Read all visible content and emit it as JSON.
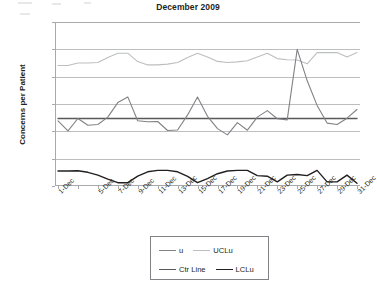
{
  "chart_data": {
    "type": "line",
    "title": "December 2009",
    "xlabel": "",
    "ylabel": "Concerns per Patient",
    "ylim": [
      0.0,
      6.0
    ],
    "ytick_values": [
      0.0,
      1.0,
      2.0,
      3.0,
      4.0,
      5.0,
      6.0
    ],
    "ytick_labels": [
      "0.00",
      "1.00",
      "2.00",
      "3.00",
      "4.00",
      "5.00",
      "6.00"
    ],
    "grid": true,
    "legend_position": "bottom",
    "x": [
      1,
      2,
      3,
      4,
      5,
      6,
      7,
      8,
      9,
      10,
      11,
      12,
      13,
      14,
      15,
      16,
      17,
      18,
      19,
      20,
      21,
      22,
      23,
      24,
      25,
      26,
      27,
      28,
      29,
      30,
      31
    ],
    "xtick_labels": [
      "1-Dec",
      "",
      "5-Dec",
      "7-Dec",
      "9-Dec",
      "11-Dec",
      "13-Dec",
      "15-Dec",
      "17-Dec",
      "19-Dec",
      "21-Dec",
      "23-Dec",
      "25-Dec",
      "27-Dec",
      "29-Dec",
      "31-Dec"
    ],
    "xtick_positions": [
      1,
      3,
      5,
      7,
      9,
      11,
      13,
      15,
      17,
      19,
      21,
      23,
      25,
      27,
      29,
      31
    ],
    "series": [
      {
        "name": "u",
        "color": "#808285",
        "width": 1.1,
        "values": [
          2.38,
          2.02,
          2.47,
          2.22,
          2.25,
          2.52,
          3.05,
          3.26,
          2.39,
          2.35,
          2.36,
          2.03,
          2.05,
          2.6,
          3.26,
          2.55,
          2.1,
          1.87,
          2.32,
          2.04,
          2.52,
          2.76,
          2.46,
          2.42,
          5.0,
          3.85,
          2.95,
          2.3,
          2.25,
          2.48,
          2.8
        ]
      },
      {
        "name": "UCLu",
        "color": "#bcbec0",
        "width": 1.1,
        "values": [
          4.41,
          4.41,
          4.5,
          4.5,
          4.52,
          4.7,
          4.86,
          4.86,
          4.55,
          4.43,
          4.43,
          4.46,
          4.52,
          4.7,
          4.86,
          4.72,
          4.56,
          4.52,
          4.54,
          4.58,
          4.72,
          4.86,
          4.66,
          4.62,
          4.61,
          4.47,
          4.88,
          4.88,
          4.88,
          4.72,
          4.88
        ]
      },
      {
        "name": "Ctr Line",
        "color": "#58595b",
        "width": 1.4,
        "values": [
          2.47,
          2.47,
          2.47,
          2.47,
          2.47,
          2.47,
          2.47,
          2.47,
          2.47,
          2.47,
          2.47,
          2.47,
          2.47,
          2.47,
          2.47,
          2.47,
          2.47,
          2.47,
          2.47,
          2.47,
          2.47,
          2.47,
          2.47,
          2.47,
          2.47,
          2.47,
          2.47,
          2.47,
          2.47,
          2.47,
          2.47
        ]
      },
      {
        "name": "LCLu",
        "color": "#231f20",
        "width": 1.4,
        "values": [
          0.55,
          0.55,
          0.56,
          0.5,
          0.4,
          0.25,
          0.12,
          0.12,
          0.36,
          0.52,
          0.57,
          0.57,
          0.52,
          0.35,
          0.12,
          0.27,
          0.45,
          0.55,
          0.57,
          0.57,
          0.38,
          0.36,
          0.15,
          0.4,
          0.42,
          0.38,
          0.57,
          0.15,
          0.15,
          0.4,
          0.1
        ]
      }
    ]
  },
  "legend": {
    "items": [
      {
        "label": "u",
        "color": "#808285"
      },
      {
        "label": "UCLu",
        "color": "#bcbec0"
      },
      {
        "label": "Ctr Line",
        "color": "#58595b"
      },
      {
        "label": "LCLu",
        "color": "#231f20"
      }
    ]
  }
}
